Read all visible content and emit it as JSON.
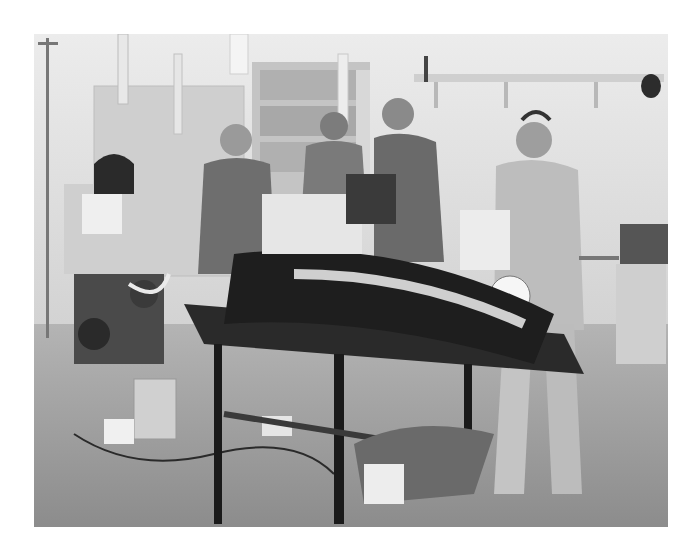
{
  "image": {
    "alt": "Grayscale photo of a medical team working around a patient on a field hospital table",
    "tone": "grayscale",
    "colors": {
      "wall": "#e4e4e4",
      "floor": "#9a9a9a",
      "shadow": "#2a2a2a",
      "mid": "#7a7a7a",
      "light": "#f2f2f2"
    },
    "scene": {
      "people": [
        {
          "id": "person-left",
          "desc": "man in t-shirt and surgical cap bending over table"
        },
        {
          "id": "person-center",
          "desc": "man in t-shirt behind the table"
        },
        {
          "id": "person-right-male",
          "desc": "man with glasses in t-shirt"
        },
        {
          "id": "person-right-female",
          "desc": "woman in gown with sunglasses on head holding a bag"
        }
      ],
      "objects": [
        "IV poles with bags",
        "anesthesia/monitoring cart",
        "wall shelves",
        "cabinet with supplies",
        "operating table with patient in dark wrap",
        "cables and equipment on floor",
        "side cart"
      ]
    }
  }
}
